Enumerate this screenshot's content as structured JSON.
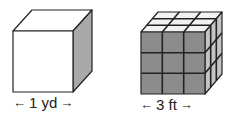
{
  "figures": [
    {
      "id": "cube-yard",
      "description": "Single cube, 1 yard on each edge",
      "label": "1 yd",
      "front_color": "#ffffff",
      "top_color": "#ffffff",
      "side_color": "#a9a9a9"
    },
    {
      "id": "cube-feet",
      "description": "Cube subdivided into 3x3x3 smaller cubes, 3 feet on each edge",
      "label": "3 ft",
      "grid": 3,
      "front_color": "#8c8c8c",
      "top_color": "#f2f2f2",
      "side_color": "#c4c4c4"
    }
  ],
  "arrows": {
    "left": "←",
    "right": "→"
  },
  "colors": {
    "stroke": "#222222"
  }
}
